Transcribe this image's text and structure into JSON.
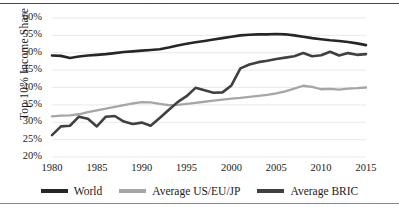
{
  "figure": {
    "frame_top_color": "#4a4a4a",
    "frame_bottom_color": "#8a8a8a",
    "background": "#ffffff",
    "cropped_caption_remnant": "· · ·"
  },
  "legend": {
    "position": "bottom-center",
    "items": [
      {
        "label": "World",
        "color": "#262626"
      },
      {
        "label": "Average US/EU/JP",
        "color": "#a6a6a6"
      },
      {
        "label": "Average BRIC",
        "color": "#404040"
      }
    ]
  },
  "axes": {
    "ylabel": "Top 10% Income Share",
    "yticks": [
      "60%",
      "55%",
      "50%",
      "45%",
      "40%",
      "35%",
      "30%",
      "25%",
      "20%"
    ],
    "xticks": [
      "1980",
      "1985",
      "1990",
      "1995",
      "2000",
      "2005",
      "2010",
      "2015"
    ],
    "grid": "horizontal",
    "grid_color": "#e3e3e3"
  },
  "chart_data": {
    "type": "line",
    "title": "",
    "xlabel": "",
    "ylabel": "Top 10% Income Share",
    "xlim": [
      1980,
      2015
    ],
    "ylim": [
      20,
      60
    ],
    "ytick_values": [
      20,
      25,
      30,
      35,
      40,
      45,
      50,
      55,
      60
    ],
    "xtick_values": [
      1980,
      1985,
      1990,
      1995,
      2000,
      2005,
      2010,
      2015
    ],
    "unit": "percent",
    "grid": true,
    "legend_position": "bottom",
    "x": [
      1980,
      1981,
      1982,
      1983,
      1984,
      1985,
      1986,
      1987,
      1988,
      1989,
      1990,
      1991,
      1992,
      1993,
      1994,
      1995,
      1996,
      1997,
      1998,
      1999,
      2000,
      2001,
      2002,
      2003,
      2004,
      2005,
      2006,
      2007,
      2008,
      2009,
      2010,
      2011,
      2012,
      2013,
      2014,
      2015
    ],
    "series": [
      {
        "name": "World",
        "color": "#262626",
        "values": [
          49.2,
          49.1,
          48.5,
          48.9,
          49.2,
          49.4,
          49.6,
          49.9,
          50.2,
          50.4,
          50.6,
          50.8,
          51.0,
          51.5,
          52.1,
          52.6,
          53.0,
          53.4,
          53.8,
          54.2,
          54.6,
          55.0,
          55.2,
          55.3,
          55.3,
          55.4,
          55.3,
          55.0,
          54.6,
          54.2,
          53.9,
          53.6,
          53.4,
          53.1,
          52.7,
          52.2
        ]
      },
      {
        "name": "Average US/EU/JP",
        "color": "#a6a6a6",
        "values": [
          31.7,
          31.9,
          32.0,
          32.3,
          32.9,
          33.4,
          33.9,
          34.4,
          34.9,
          35.4,
          35.8,
          35.7,
          35.3,
          34.9,
          35.0,
          35.3,
          35.6,
          35.9,
          36.2,
          36.5,
          36.8,
          37.0,
          37.3,
          37.6,
          37.9,
          38.3,
          38.9,
          39.7,
          40.5,
          40.2,
          39.5,
          39.6,
          39.4,
          39.7,
          39.8,
          40.0
        ]
      },
      {
        "name": "Average BRIC",
        "color": "#404040",
        "values": [
          26.3,
          28.8,
          29.0,
          31.6,
          31.0,
          28.8,
          31.6,
          31.8,
          30.2,
          29.5,
          29.9,
          29.0,
          31.2,
          33.5,
          35.8,
          37.5,
          39.9,
          39.2,
          38.5,
          38.6,
          40.6,
          45.5,
          46.6,
          47.3,
          47.7,
          48.2,
          48.6,
          49.0,
          49.9,
          49.0,
          49.3,
          50.3,
          49.2,
          49.9,
          49.4,
          49.6
        ]
      }
    ]
  }
}
